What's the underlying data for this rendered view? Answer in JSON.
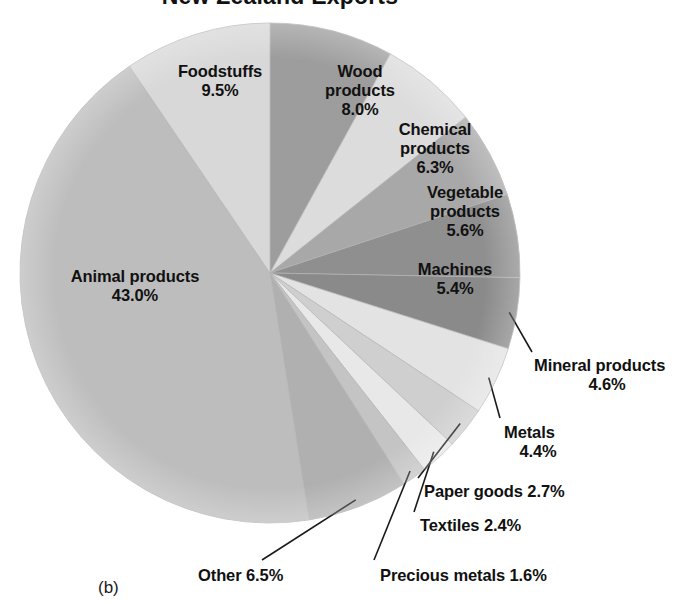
{
  "figure": {
    "title": "New Zealand Exports",
    "caption": "(b)"
  },
  "chart_data": {
    "type": "pie",
    "title": "New Zealand Exports",
    "xlabel": "",
    "ylabel": "",
    "units": "percent",
    "total": 100.0,
    "start_angle_deg": 0,
    "direction": "clockwise",
    "legend": "none (direct labels)",
    "grid": false,
    "categories": [
      "Wood products",
      "Chemical products",
      "Vegetable products",
      "Machines",
      "Mineral products",
      "Metals",
      "Paper goods",
      "Textiles",
      "Precious metals",
      "Other",
      "Animal products",
      "Foodstuffs"
    ],
    "values": [
      8.0,
      6.3,
      5.6,
      5.4,
      4.6,
      4.4,
      2.7,
      2.4,
      1.6,
      6.5,
      43.0,
      9.5
    ],
    "slices": [
      {
        "label": "Wood products",
        "value": 8.0,
        "value_text": "8.0%",
        "color": "#9d9d9d",
        "label_placement": "inside"
      },
      {
        "label": "Chemical products",
        "value": 6.3,
        "value_text": "6.3%",
        "color": "#dcdcdc",
        "label_placement": "inside"
      },
      {
        "label": "Vegetable products",
        "value": 5.6,
        "value_text": "5.6%",
        "color": "#a8a8a8",
        "label_placement": "inside"
      },
      {
        "label": "Machines",
        "value": 5.4,
        "value_text": "5.4%",
        "color": "#8f8f8f",
        "label_placement": "inside"
      },
      {
        "label": "Mineral products",
        "value": 4.6,
        "value_text": "4.6%",
        "color": "#8a8a8a",
        "label_placement": "leader"
      },
      {
        "label": "Metals",
        "value": 4.4,
        "value_text": "4.4%",
        "color": "#e3e3e3",
        "label_placement": "leader"
      },
      {
        "label": "Paper goods",
        "value": 2.7,
        "value_text": "2.7%",
        "color": "#cfcfcf",
        "label_placement": "leader"
      },
      {
        "label": "Textiles",
        "value": 2.4,
        "value_text": "2.4%",
        "color": "#e8e8e8",
        "label_placement": "leader"
      },
      {
        "label": "Precious metals",
        "value": 1.6,
        "value_text": "1.6%",
        "color": "#c4c4c4",
        "label_placement": "leader"
      },
      {
        "label": "Other",
        "value": 6.5,
        "value_text": "6.5%",
        "color": "#b0b0b0",
        "label_placement": "leader"
      },
      {
        "label": "Animal products",
        "value": 43.0,
        "value_text": "43.0%",
        "color": "#bdbdbd",
        "label_placement": "inside"
      },
      {
        "label": "Foodstuffs",
        "value": 9.5,
        "value_text": "9.5%",
        "color": "#d8d8d8",
        "label_placement": "inside"
      }
    ]
  },
  "labels": {
    "foodstuffs": {
      "name": "Foodstuffs",
      "pct": "9.5%"
    },
    "wood_products": {
      "name": "Wood",
      "name2": "products",
      "pct": "8.0%"
    },
    "chemical_products": {
      "name": "Chemical",
      "name2": "products",
      "pct": "6.3%"
    },
    "vegetable_products": {
      "name": "Vegetable",
      "name2": "products",
      "pct": "5.6%"
    },
    "machines": {
      "name": "Machines",
      "pct": "5.4%"
    },
    "mineral_products": {
      "name": "Mineral products",
      "pct": "4.6%"
    },
    "metals": {
      "name": "Metals",
      "pct": "4.4%"
    },
    "paper_goods": {
      "text": "Paper goods 2.7%"
    },
    "textiles": {
      "text": "Textiles 2.4%"
    },
    "precious_metals": {
      "text": "Precious metals 1.6%"
    },
    "other": {
      "text": "Other 6.5%"
    },
    "animal_products": {
      "name": "Animal products",
      "pct": "43.0%"
    }
  },
  "colors": {
    "background": "#ffffff",
    "text": "#111111",
    "leader_line": "#1a1a1a",
    "slice_edge": "#b5b5b5"
  }
}
